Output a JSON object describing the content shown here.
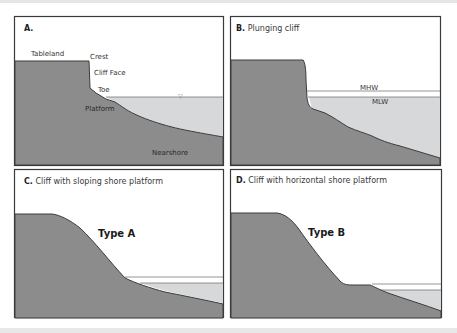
{
  "figure": {
    "panels": [
      {
        "id": "A",
        "letter": "A.",
        "title": "",
        "labels": {
          "tableland": "Tableland",
          "crest": "Crest",
          "cliff_face": "Cliff Face",
          "toe": "Toe",
          "platform": "Platform",
          "nearshore": "Nearshore",
          "water_symbol": "▽"
        }
      },
      {
        "id": "B",
        "letter": "B.",
        "title": "Plunging cliff",
        "labels": {
          "mhw": "MHW",
          "mlw": "MLW"
        }
      },
      {
        "id": "C",
        "letter": "C.",
        "title": "Cliff with sloping shore platform",
        "type_label": "Type A"
      },
      {
        "id": "D",
        "letter": "D.",
        "title": "Cliff with horizontal shore platform",
        "type_label": "Type B"
      }
    ],
    "colors": {
      "rock": "#8c8c8c",
      "water": "#d6d8d9",
      "outline": "#3c3c3c",
      "frame": "#3a3a3a"
    }
  }
}
